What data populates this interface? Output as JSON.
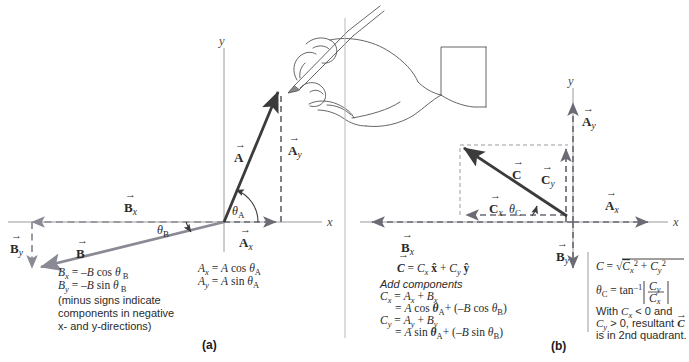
{
  "figure": {
    "colors": {
      "vector_A": "#3b3b3b",
      "vector_B": "#8a8a94",
      "vector_C": "#3b3b3b",
      "dashed_component": "#6b6b75",
      "axis": "#8a8a8a",
      "text": "#2b2b2b",
      "hand_line": "#555555",
      "background": "#ffffff"
    }
  },
  "panel_a": {
    "caption": "(a)",
    "axes": {
      "x_label": "x",
      "y_label": "y"
    },
    "vectors": [
      {
        "name": "A",
        "label": "A",
        "sub": "",
        "kind": "solid",
        "color": "#3b3b3b"
      },
      {
        "name": "Ay",
        "label": "A",
        "sub": "y",
        "kind": "dashed",
        "color": "#6b6b75"
      },
      {
        "name": "Ax",
        "label": "A",
        "sub": "x",
        "kind": "dashed",
        "color": "#6b6b75"
      },
      {
        "name": "B",
        "label": "B",
        "sub": "",
        "kind": "solid",
        "color": "#8a8a94"
      },
      {
        "name": "Bx",
        "label": "B",
        "sub": "x",
        "kind": "dashed",
        "color": "#8a8a94"
      },
      {
        "name": "By",
        "label": "B",
        "sub": "y",
        "kind": "dashed",
        "color": "#8a8a94"
      }
    ],
    "angles": [
      {
        "name": "theta_A",
        "symbol": "θ",
        "sub": "A"
      },
      {
        "name": "theta_B",
        "symbol": "θ",
        "sub": "B"
      }
    ],
    "equations_A": [
      {
        "lhs": "A",
        "lhs_sub": "x",
        "rhs": "= A cos θ",
        "rhs_sub": "A"
      },
      {
        "lhs": "A",
        "lhs_sub": "y",
        "rhs": "= A sin θ",
        "rhs_sub": "A"
      }
    ],
    "equations_B": [
      {
        "lhs": "B",
        "lhs_sub": "x",
        "rhs": "= –B cos θ",
        "rhs_sub": "B"
      },
      {
        "lhs": "B",
        "lhs_sub": "y",
        "rhs": "= –B sin  θ",
        "rhs_sub": "B"
      }
    ],
    "note_lines": [
      "(minus signs indicate",
      "components in negative",
      "x- and y-directions)"
    ],
    "illustration": {
      "name": "hand-holding-pencil",
      "description": "Line drawing of a hand holding a pencil drawing the tip of vector A"
    }
  },
  "panel_b": {
    "caption": "(b)",
    "axes": {
      "x_label": "x",
      "y_label": "y"
    },
    "vectors": [
      {
        "name": "C",
        "label": "C",
        "sub": "",
        "kind": "solid",
        "color": "#3b3b3b"
      },
      {
        "name": "Cx",
        "label": "C",
        "sub": "x",
        "kind": "dashed",
        "color": "#6b6b75"
      },
      {
        "name": "Cy",
        "label": "C",
        "sub": "y",
        "kind": "dashed",
        "color": "#6b6b75"
      },
      {
        "name": "Ax",
        "label": "A",
        "sub": "x",
        "kind": "dashed",
        "color": "#6b6b75"
      },
      {
        "name": "Ay",
        "label": "A",
        "sub": "y",
        "kind": "dashed",
        "color": "#6b6b75"
      },
      {
        "name": "Bx",
        "label": "B",
        "sub": "x",
        "kind": "dashed",
        "color": "#6b6b75"
      },
      {
        "name": "By",
        "label": "B",
        "sub": "y",
        "kind": "dashed",
        "color": "#6b6b75"
      }
    ],
    "angles": [
      {
        "name": "theta_C",
        "symbol": "θ",
        "sub": "C"
      }
    ],
    "vector_equation": {
      "lhs": "C",
      "rhs_cx": "C",
      "rhs_cx_sub": "x",
      "xhat": "x̂",
      "plus": "+",
      "rhs_cy": "C",
      "rhs_cy_sub": "y",
      "yhat": "ŷ"
    },
    "add_components_heading": "Add components",
    "component_equations": [
      {
        "line": "Cx = Ax + Bx"
      },
      {
        "line": "= A cos θA+ (–B cos θB)"
      },
      {
        "line": "Cy = Ay + By"
      },
      {
        "line": "= A sin θA+ (–B sin θB)"
      }
    ],
    "magnitude_equation": "C = √(Cx² + Cy²)",
    "angle_equation": "θC = tan⁻¹ |Cy / Cx|",
    "quadrant_note_lines": [
      "With C",
      " < 0 and",
      "C",
      " > 0, resultant ",
      "is in 2nd quadrant."
    ],
    "quadrant_note_plain": "With Cx < 0 and Cy > 0, resultant C is in 2nd quadrant."
  }
}
